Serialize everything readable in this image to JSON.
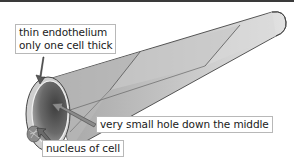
{
  "diagram": {
    "labels": {
      "endothelium": {
        "line1": "thin endothelium",
        "line2": "only one cell thick"
      },
      "lumen": {
        "text": "very small hole down the middle"
      },
      "nucleus": {
        "text": "nucleus of cell"
      }
    },
    "colors": {
      "tube_light": "#e6e6e6",
      "tube_mid": "#b5b5b5",
      "tube_dark": "#7a7a7a",
      "arrow": "#555555",
      "label_border": "#b8b8b8",
      "top_bar": "#3a3a3a"
    }
  }
}
